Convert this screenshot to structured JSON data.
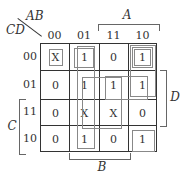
{
  "kmap": {
    "row_var": "CD",
    "col_var": "AB",
    "col_headers": [
      "00",
      "01",
      "11",
      "10"
    ],
    "row_headers": [
      "00",
      "01",
      "11",
      "10"
    ],
    "cells": [
      [
        "X",
        "1",
        "0",
        "1"
      ],
      [
        "0",
        "1",
        "1",
        "1"
      ],
      [
        "0",
        "X",
        "X",
        "0"
      ],
      [
        "0",
        "1",
        "0",
        "1"
      ]
    ],
    "brackets": {
      "A": "A",
      "B": "B",
      "C": "C",
      "D": "D"
    }
  }
}
